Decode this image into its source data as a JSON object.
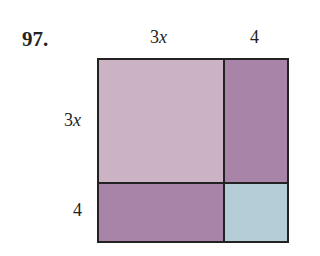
{
  "problem_number": "97.",
  "labels": {
    "top_left": {
      "coef": "3",
      "var": "x"
    },
    "top_right": "4",
    "side_top": {
      "coef": "3",
      "var": "x"
    },
    "side_bottom": "4"
  },
  "colors": {
    "big_square": "#cbb3c4",
    "rectangles": "#a884a8",
    "small_square": "#b4cdd6",
    "border": "#222222"
  }
}
